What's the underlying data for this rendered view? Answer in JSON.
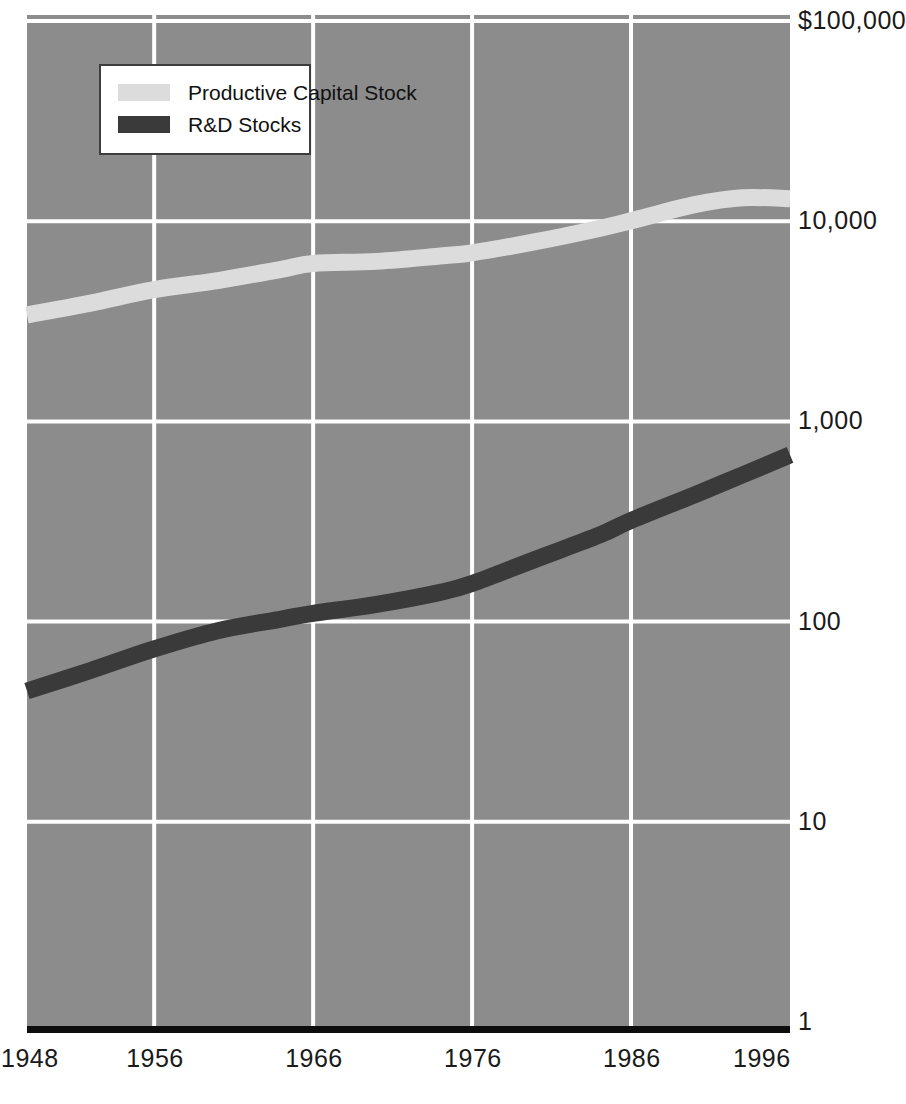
{
  "chart_data": {
    "type": "line",
    "title": "",
    "subtitle": "",
    "xlabel": "",
    "ylabel": "",
    "yscale": "log",
    "ylim": [
      1,
      100000
    ],
    "xlim": [
      1948,
      1996
    ],
    "grid": true,
    "background_color": "#8c8c8c",
    "gridline_color": "#ffffff",
    "axis_color": "#0d0d0d",
    "legend_position": "top-left",
    "y_ticks": [
      1,
      10,
      100,
      1000,
      10000,
      100000
    ],
    "y_tick_labels": [
      "1",
      "10",
      "100",
      "1,000",
      "10,000",
      "$100,000"
    ],
    "x_ticks": [
      1948,
      1956,
      1966,
      1976,
      1986,
      1996
    ],
    "x_tick_labels": [
      "1948",
      "1956",
      "1966",
      "1976",
      "1986",
      "1996"
    ],
    "series": [
      {
        "name": "Productive Capital Stock",
        "color": "#dcdcdc",
        "x": [
          1948,
          1952,
          1956,
          1960,
          1964,
          1966,
          1970,
          1974,
          1976,
          1980,
          1984,
          1986,
          1990,
          1993,
          1996
        ],
        "values": [
          3400,
          3900,
          4550,
          5050,
          5750,
          6150,
          6300,
          6700,
          6950,
          7900,
          9200,
          10050,
          12100,
          13100,
          12950
        ]
      },
      {
        "name": "R&D Stocks",
        "color": "#3a3a3a",
        "x": [
          1948,
          1952,
          1956,
          1960,
          1964,
          1966,
          1970,
          1974,
          1976,
          1980,
          1984,
          1986,
          1990,
          1993,
          1996
        ],
        "values": [
          45,
          57,
          73,
          90,
          103,
          110,
          122,
          140,
          155,
          205,
          270,
          320,
          430,
          540,
          680
        ]
      }
    ]
  },
  "legend": {
    "items": [
      {
        "label": "Productive Capital Stock",
        "color": "#dcdcdc"
      },
      {
        "label": "R&D Stocks",
        "color": "#3a3a3a"
      }
    ]
  },
  "axes": {
    "y_labels": [
      {
        "text": "$100,000",
        "value": 100000
      },
      {
        "text": "10,000",
        "value": 10000
      },
      {
        "text": "1,000",
        "value": 1000
      },
      {
        "text": "100",
        "value": 100
      },
      {
        "text": "10",
        "value": 10
      },
      {
        "text": "1",
        "value": 1
      }
    ],
    "x_labels": [
      {
        "text": "1948",
        "value": 1948
      },
      {
        "text": "1956",
        "value": 1956
      },
      {
        "text": "1966",
        "value": 1966
      },
      {
        "text": "1976",
        "value": 1976
      },
      {
        "text": "1986",
        "value": 1986
      },
      {
        "text": "1996",
        "value": 1996
      }
    ]
  }
}
